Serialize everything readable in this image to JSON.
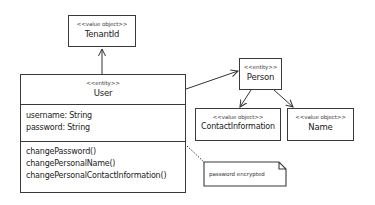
{
  "diagram": {
    "type": "UML class diagram",
    "classes": [
      {
        "id": "tenantid",
        "stereotype": "<<value object>>",
        "name": "TenantId"
      },
      {
        "id": "user",
        "stereotype": "<<entity>>",
        "name": "User",
        "attributes": [
          "username: String",
          "password: String"
        ],
        "methods": [
          "changePassword()",
          "changePersonalName()",
          "changePersonalContactInformation()"
        ]
      },
      {
        "id": "person",
        "stereotype": "<<entity>>",
        "name": "Person"
      },
      {
        "id": "contactinformation",
        "stereotype": "<<value object>>",
        "name": "ContactInformation"
      },
      {
        "id": "name",
        "stereotype": "<<value object>>",
        "name": "Name"
      }
    ],
    "note": {
      "text": "password encrypted",
      "attached_to": "user.password"
    },
    "associations": [
      {
        "from": "User",
        "to": "TenantId"
      },
      {
        "from": "User",
        "to": "Person"
      },
      {
        "from": "Person",
        "to": "ContactInformation"
      },
      {
        "from": "Person",
        "to": "Name"
      }
    ]
  }
}
